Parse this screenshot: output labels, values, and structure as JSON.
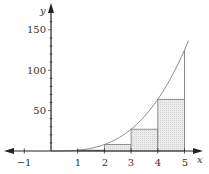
{
  "chart_data": {
    "type": "area",
    "title": "",
    "function": "y = x^3",
    "xlabel": "x",
    "ylabel": "y",
    "xlim": [
      -1.9,
      5.6
    ],
    "ylim": [
      -12,
      170
    ],
    "x_ticks": [
      -1,
      1,
      2,
      3,
      4,
      5
    ],
    "x_tick_labels": [
      "−1",
      "1",
      "2",
      "3",
      "4",
      "5"
    ],
    "y_ticks": [
      50,
      100,
      150
    ],
    "y_tick_labels": [
      "50",
      "100",
      "150"
    ],
    "y_minor_step": 10,
    "grid": false,
    "curve": {
      "x": [
        0,
        0.5,
        1,
        1.5,
        2,
        2.5,
        3,
        3.5,
        4,
        4.5,
        5
      ],
      "y": [
        0,
        0.125,
        1,
        3.375,
        8,
        15.625,
        27,
        42.875,
        64,
        91.125,
        125
      ]
    },
    "rectangles": [
      {
        "x_start": 1,
        "x_end": 2,
        "height": 1
      },
      {
        "x_start": 2,
        "x_end": 3,
        "height": 8
      },
      {
        "x_start": 3,
        "x_end": 4,
        "height": 27
      },
      {
        "x_start": 4,
        "x_end": 5,
        "height": 64
      }
    ],
    "vertical_line": {
      "x": 5,
      "y_top": 125
    },
    "colors": {
      "curve": "#888888",
      "rect_fill": "#e6e6e6",
      "rect_stroke": "#777777",
      "axis": "#222222"
    }
  },
  "labels": {
    "x_axis": "x",
    "y_axis": "y",
    "x_ticks": [
      "−1",
      "1",
      "2",
      "3",
      "4",
      "5"
    ],
    "y_ticks": [
      "150",
      "100",
      "50"
    ]
  }
}
